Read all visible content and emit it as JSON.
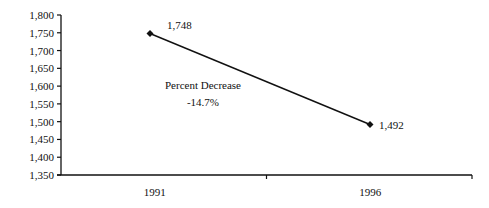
{
  "chart_data": {
    "type": "line",
    "title": "",
    "xlabel": "",
    "ylabel": "",
    "categories": [
      "1991",
      "1996"
    ],
    "series": [
      {
        "name": "",
        "values": [
          1748,
          1492
        ],
        "labels": [
          "1,748",
          "1,492"
        ],
        "marker": "diamond"
      }
    ],
    "ylim": [
      1350,
      1800
    ],
    "yticks": [
      1350,
      1400,
      1450,
      1500,
      1550,
      1600,
      1650,
      1700,
      1750,
      1800
    ],
    "ytick_labels": [
      "1,350",
      "1,400",
      "1,450",
      "1,500",
      "1,550",
      "1,600",
      "1,650",
      "1,700",
      "1,750",
      "1,800"
    ],
    "annotations": [
      {
        "text_line1": "Percent Decrease",
        "text_line2": "-14.7%"
      }
    ],
    "grid": false,
    "legend": "none"
  },
  "colors": {
    "line": "#111111",
    "axis": "#111111",
    "background": "#ffffff"
  }
}
